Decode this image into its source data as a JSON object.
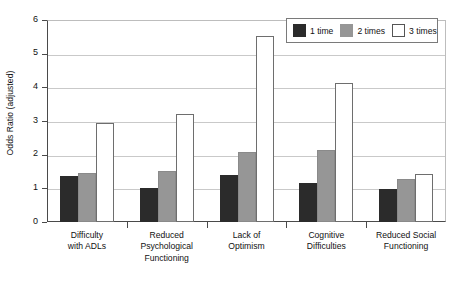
{
  "chart_data": {
    "type": "bar",
    "title": "",
    "xlabel": "",
    "ylabel": "Odds Ratio (adjusted)",
    "ylim": [
      0,
      6
    ],
    "ytick_labels": [
      "0",
      "1",
      "2",
      "3",
      "4",
      "5",
      "6"
    ],
    "ytick_values": [
      0,
      1,
      2,
      3,
      4,
      5,
      6
    ],
    "grid": true,
    "legend_position": "top-right",
    "categories": [
      "Difficulty\nwith ADLs",
      "Reduced\nPsychological\nFunctioning",
      "Lack of\nOptimism",
      "Cognitive\nDifficulties",
      "Reduced Social\nFunctioning"
    ],
    "category_lines": [
      [
        "Difficulty",
        "with ADLs"
      ],
      [
        "Reduced",
        "Psychological",
        "Functioning"
      ],
      [
        "Lack of",
        "Optimism"
      ],
      [
        "Cognitive",
        "Difficulties"
      ],
      [
        "Reduced Social",
        "Functioning"
      ]
    ],
    "series": [
      {
        "name": "1 time",
        "color": "#2b2b2b",
        "values": [
          1.38,
          1.0,
          1.4,
          1.15,
          0.97
        ]
      },
      {
        "name": "2 times",
        "color": "#969696",
        "values": [
          1.45,
          1.53,
          2.07,
          2.13,
          1.27
        ]
      },
      {
        "name": "3 times",
        "color": "#ffffff",
        "values": [
          2.95,
          3.2,
          5.52,
          4.12,
          1.42
        ]
      }
    ]
  },
  "legend": {
    "items": [
      {
        "label": "1 time",
        "swatch": "#2b2b2b"
      },
      {
        "label": "2 times",
        "swatch": "#969696"
      },
      {
        "label": "3 times",
        "swatch": "#ffffff"
      }
    ]
  },
  "axis": {
    "y_title": "Odds Ratio (adjusted)"
  }
}
